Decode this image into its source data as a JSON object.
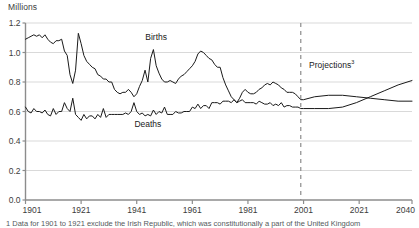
{
  "axis_unit_label": "Millions",
  "footnote": "1 Data for 1901 to 1921 exclude the Irish Republic, which was constitutionally a part of the United Kingdom",
  "labels": {
    "births": "Births",
    "deaths": "Deaths",
    "projections": "Projections",
    "projections_superscript": "3"
  },
  "colors": {
    "line": "#1a1a1a",
    "axis": "#8c8c8c",
    "grid": "#d9d9d9",
    "divider": "#8c8c8c",
    "text": "#3c3c3c",
    "background": "#ffffff"
  },
  "chart_data": {
    "type": "line",
    "title": "",
    "subtitle": "",
    "xlabel": "",
    "ylabel": "Millions",
    "xlim": [
      1901,
      2040
    ],
    "ylim": [
      0.0,
      1.2
    ],
    "grid": true,
    "legend": "inline-annotations",
    "yticks": [
      "0.0",
      "0.2",
      "0.4",
      "0.6",
      "0.8",
      "1.0",
      "1.2"
    ],
    "ytick_values": [
      0.0,
      0.2,
      0.4,
      0.6,
      0.8,
      1.0,
      1.2
    ],
    "xticks": [
      "1901",
      "1921",
      "1941",
      "1961",
      "1981",
      "2001",
      "2021",
      "2040"
    ],
    "xtick_values": [
      1901,
      1921,
      1941,
      1961,
      1981,
      2001,
      2021,
      2040
    ],
    "annotations": [
      {
        "text": "Births",
        "x": 1948,
        "y": 1.09
      },
      {
        "text": "Deaths",
        "x": 1945,
        "y": 0.5
      },
      {
        "text": "Projections3",
        "x": 2005,
        "y": 0.9
      }
    ],
    "projection_divider_x": 2000,
    "series": [
      {
        "name": "Births",
        "x": [
          1901,
          1902,
          1903,
          1904,
          1905,
          1906,
          1907,
          1908,
          1909,
          1910,
          1911,
          1912,
          1913,
          1914,
          1915,
          1916,
          1917,
          1918,
          1919,
          1920,
          1921,
          1922,
          1923,
          1924,
          1925,
          1926,
          1927,
          1928,
          1929,
          1930,
          1931,
          1932,
          1933,
          1934,
          1935,
          1936,
          1937,
          1938,
          1939,
          1940,
          1941,
          1942,
          1943,
          1944,
          1945,
          1946,
          1947,
          1948,
          1949,
          1950,
          1951,
          1952,
          1953,
          1954,
          1955,
          1956,
          1957,
          1958,
          1959,
          1960,
          1961,
          1962,
          1963,
          1964,
          1965,
          1966,
          1967,
          1968,
          1969,
          1970,
          1971,
          1972,
          1973,
          1974,
          1975,
          1976,
          1977,
          1978,
          1979,
          1980,
          1981,
          1982,
          1983,
          1984,
          1985,
          1986,
          1987,
          1988,
          1989,
          1990,
          1991,
          1992,
          1993,
          1994,
          1995,
          1996,
          1997,
          1998,
          1999,
          2000,
          2001,
          2005,
          2010,
          2015,
          2020,
          2025,
          2030,
          2035,
          2040
        ],
        "values": [
          1.09,
          1.1,
          1.11,
          1.12,
          1.11,
          1.12,
          1.1,
          1.12,
          1.09,
          1.07,
          1.06,
          1.08,
          1.08,
          1.09,
          1.01,
          0.98,
          0.85,
          0.79,
          0.88,
          1.13,
          1.06,
          0.98,
          0.94,
          0.92,
          0.9,
          0.89,
          0.85,
          0.84,
          0.82,
          0.82,
          0.8,
          0.8,
          0.75,
          0.73,
          0.72,
          0.73,
          0.73,
          0.75,
          0.73,
          0.7,
          0.72,
          0.77,
          0.81,
          0.88,
          0.8,
          0.96,
          1.02,
          0.91,
          0.86,
          0.82,
          0.8,
          0.8,
          0.81,
          0.8,
          0.79,
          0.82,
          0.84,
          0.85,
          0.87,
          0.89,
          0.91,
          0.94,
          0.99,
          1.01,
          1.0,
          0.98,
          0.96,
          0.95,
          0.92,
          0.9,
          0.9,
          0.83,
          0.78,
          0.74,
          0.7,
          0.68,
          0.66,
          0.69,
          0.73,
          0.75,
          0.73,
          0.72,
          0.72,
          0.73,
          0.75,
          0.76,
          0.78,
          0.79,
          0.78,
          0.8,
          0.79,
          0.78,
          0.76,
          0.75,
          0.73,
          0.73,
          0.73,
          0.72,
          0.7,
          0.68,
          0.68,
          0.7,
          0.71,
          0.71,
          0.7,
          0.69,
          0.68,
          0.67,
          0.67
        ]
      },
      {
        "name": "Deaths",
        "x": [
          1901,
          1902,
          1903,
          1904,
          1905,
          1906,
          1907,
          1908,
          1909,
          1910,
          1911,
          1912,
          1913,
          1914,
          1915,
          1916,
          1917,
          1918,
          1919,
          1920,
          1921,
          1922,
          1923,
          1924,
          1925,
          1926,
          1927,
          1928,
          1929,
          1930,
          1931,
          1932,
          1933,
          1934,
          1935,
          1936,
          1937,
          1938,
          1939,
          1940,
          1941,
          1942,
          1943,
          1944,
          1945,
          1946,
          1947,
          1948,
          1949,
          1950,
          1951,
          1952,
          1953,
          1954,
          1955,
          1956,
          1957,
          1958,
          1959,
          1960,
          1961,
          1962,
          1963,
          1964,
          1965,
          1966,
          1967,
          1968,
          1969,
          1970,
          1971,
          1972,
          1973,
          1974,
          1975,
          1976,
          1977,
          1978,
          1979,
          1980,
          1981,
          1982,
          1983,
          1984,
          1985,
          1986,
          1987,
          1988,
          1989,
          1990,
          1991,
          1992,
          1993,
          1994,
          1995,
          1996,
          1997,
          1998,
          1999,
          2000,
          2001,
          2005,
          2010,
          2015,
          2020,
          2025,
          2030,
          2035,
          2040
        ],
        "values": [
          0.63,
          0.6,
          0.59,
          0.62,
          0.6,
          0.6,
          0.59,
          0.61,
          0.58,
          0.57,
          0.62,
          0.58,
          0.6,
          0.6,
          0.66,
          0.62,
          0.6,
          0.69,
          0.58,
          0.56,
          0.54,
          0.58,
          0.55,
          0.57,
          0.57,
          0.55,
          0.58,
          0.56,
          0.62,
          0.56,
          0.58,
          0.58,
          0.58,
          0.58,
          0.58,
          0.58,
          0.59,
          0.58,
          0.6,
          0.66,
          0.6,
          0.58,
          0.59,
          0.57,
          0.58,
          0.57,
          0.61,
          0.58,
          0.6,
          0.59,
          0.63,
          0.58,
          0.58,
          0.58,
          0.6,
          0.59,
          0.59,
          0.6,
          0.6,
          0.6,
          0.63,
          0.62,
          0.65,
          0.62,
          0.64,
          0.64,
          0.62,
          0.66,
          0.66,
          0.66,
          0.65,
          0.67,
          0.67,
          0.67,
          0.66,
          0.68,
          0.66,
          0.67,
          0.68,
          0.66,
          0.66,
          0.66,
          0.66,
          0.65,
          0.67,
          0.66,
          0.65,
          0.65,
          0.66,
          0.64,
          0.65,
          0.64,
          0.66,
          0.63,
          0.64,
          0.64,
          0.63,
          0.63,
          0.63,
          0.62,
          0.62,
          0.62,
          0.62,
          0.63,
          0.66,
          0.7,
          0.74,
          0.78,
          0.81
        ]
      }
    ]
  }
}
